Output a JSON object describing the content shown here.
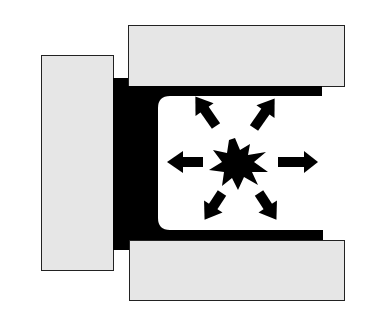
{
  "diagram": {
    "type": "pressure-explosion-schematic",
    "colors": {
      "background": "#ffffff",
      "block_fill": "#e6e6e6",
      "block_stroke": "#222222",
      "liner": "#000000",
      "chamber": "#ffffff",
      "arrows": "#000000"
    },
    "elements": {
      "left_block": "gray-block",
      "top_block": "gray-block",
      "bottom_block": "gray-block",
      "liner": "black-c-shaped-liner",
      "chamber": "open-chamber",
      "burst": "explosion-starburst",
      "arrows": [
        "up-left",
        "up-right",
        "left",
        "right",
        "down-left",
        "down-right"
      ]
    }
  }
}
